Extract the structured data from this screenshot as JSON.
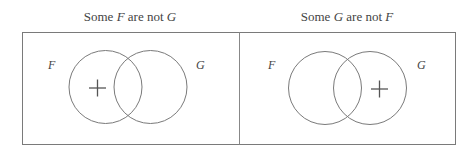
{
  "panels": [
    {
      "title_parts": [
        "Some ",
        "F",
        " are not ",
        "G"
      ],
      "labels": {
        "left": "F",
        "right": "G"
      },
      "marker": {
        "symbol": "+",
        "region": "F only"
      }
    },
    {
      "title_parts": [
        "Some ",
        "G",
        " are not ",
        "F"
      ],
      "labels": {
        "left": "F",
        "right": "G"
      },
      "marker": {
        "symbol": "+",
        "region": "G only"
      }
    }
  ],
  "colors": {
    "line": "#777777",
    "text": "#444444",
    "background": "#ffffff"
  }
}
